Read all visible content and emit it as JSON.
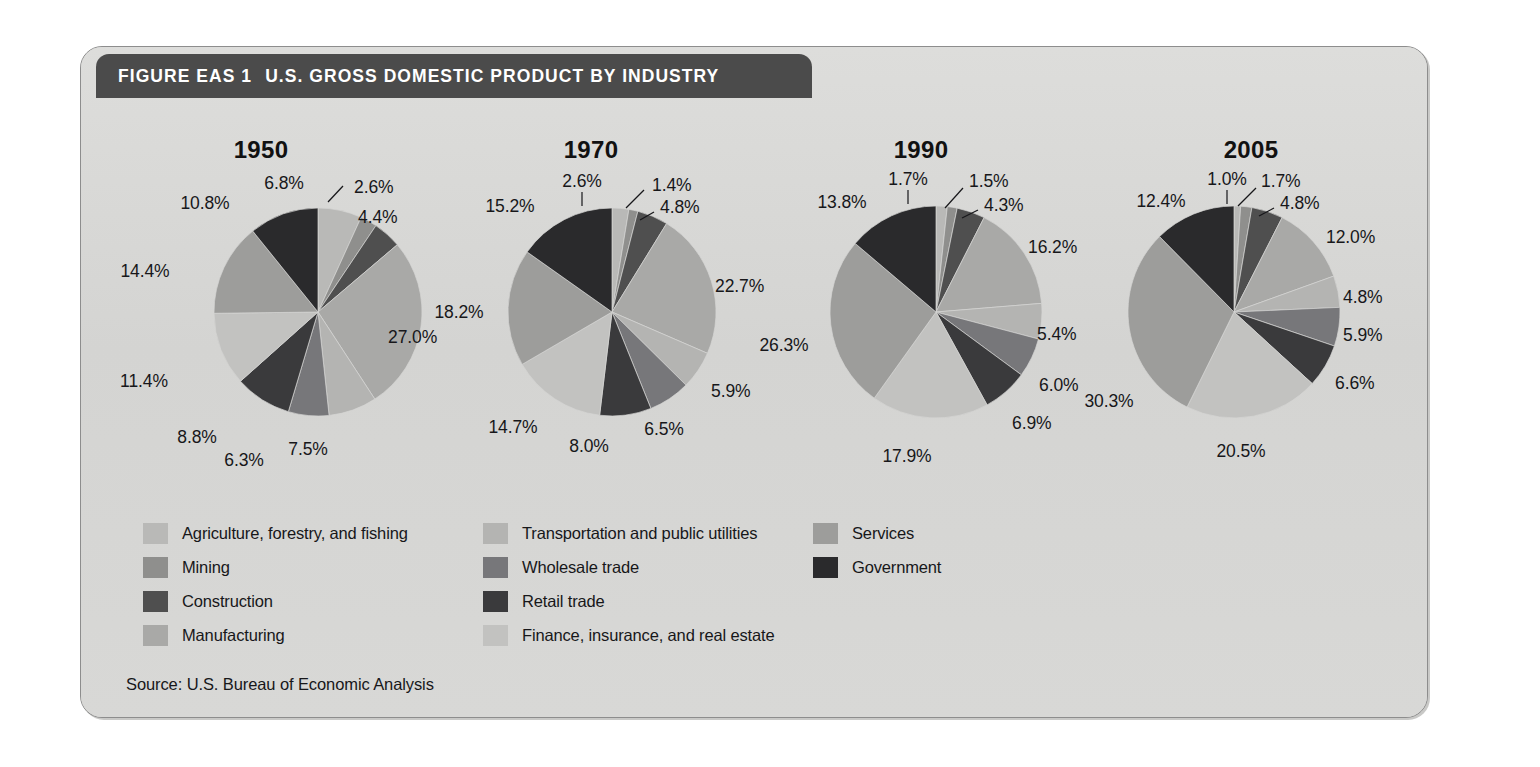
{
  "header": {
    "figure_number": "FIGURE EAS 1",
    "title": "U.S. GROSS DOMESTIC PRODUCT BY INDUSTRY"
  },
  "source": "Source: U.S. Bureau of Economic Analysis",
  "colors": {
    "agriculture": "#b9b9b7",
    "mining": "#8f8f8d",
    "construction": "#4f4f4f",
    "manufacturing": "#a9a9a7",
    "transportation": "#b4b4b2",
    "wholesale": "#77777a",
    "retail": "#3a3a3c",
    "finance": "#c2c2c0",
    "services": "#9d9d9b",
    "government": "#2a2a2c",
    "panel_background": "#d6d6d4",
    "header_bar": "#4b4b4b",
    "text": "#17171a"
  },
  "legend": {
    "columns": [
      [
        {
          "label": "Agriculture, forestry, and fishing",
          "key": "agriculture"
        },
        {
          "label": "Mining",
          "key": "mining"
        },
        {
          "label": "Construction",
          "key": "construction"
        },
        {
          "label": "Manufacturing",
          "key": "manufacturing"
        }
      ],
      [
        {
          "label": "Transportation and public utilities",
          "key": "transportation"
        },
        {
          "label": "Wholesale trade",
          "key": "wholesale"
        },
        {
          "label": "Retail trade",
          "key": "retail"
        },
        {
          "label": "Finance, insurance, and real estate",
          "key": "finance"
        }
      ],
      [
        {
          "label": "Services",
          "key": "services"
        },
        {
          "label": "Government",
          "key": "government"
        }
      ]
    ]
  },
  "chart_data": [
    {
      "type": "pie",
      "title": "1950",
      "unit": "%",
      "start_angle": 0,
      "direction": "clockwise",
      "categories": [
        "Agriculture, forestry, and fishing",
        "Mining",
        "Construction",
        "Manufacturing",
        "Transportation and public utilities",
        "Wholesale trade",
        "Retail trade",
        "Finance, insurance, and real estate",
        "Services",
        "Government"
      ],
      "keys": [
        "agriculture",
        "mining",
        "construction",
        "manufacturing",
        "transportation",
        "wholesale",
        "retail",
        "finance",
        "services",
        "government"
      ],
      "values": [
        6.8,
        2.6,
        4.4,
        27.0,
        7.5,
        6.3,
        8.8,
        11.4,
        14.4,
        10.8
      ],
      "labels": [
        "6.8%",
        "2.6%",
        "4.4%",
        "27.0%",
        "7.5%",
        "6.3%",
        "8.8%",
        "11.4%",
        "14.4%",
        "10.8%"
      ],
      "label_pos": [
        {
          "x": 188,
          "y": 64,
          "anchor": "middle"
        },
        {
          "x": 258,
          "y": 68,
          "anchor": "start"
        },
        {
          "x": 262,
          "y": 98,
          "anchor": "start"
        },
        {
          "x": 292,
          "y": 218,
          "anchor": "start"
        },
        {
          "x": 212,
          "y": 330,
          "anchor": "middle"
        },
        {
          "x": 148,
          "y": 341,
          "anchor": "middle"
        },
        {
          "x": 101,
          "y": 318,
          "anchor": "middle"
        },
        {
          "x": 48,
          "y": 262,
          "anchor": "middle"
        },
        {
          "x": 49,
          "y": 152,
          "anchor": "middle"
        },
        {
          "x": 109,
          "y": 84,
          "anchor": "middle"
        }
      ],
      "leaders": [
        {
          "from": [
            247,
            66
          ],
          "to": [
            232,
            82
          ]
        }
      ],
      "center": [
        222,
        192
      ],
      "radius": 104
    },
    {
      "type": "pie",
      "title": "1970",
      "unit": "%",
      "start_angle": 0,
      "direction": "clockwise",
      "categories": [
        "Agriculture, forestry, and fishing",
        "Mining",
        "Construction",
        "Manufacturing",
        "Transportation and public utilities",
        "Wholesale trade",
        "Retail trade",
        "Finance, insurance, and real estate",
        "Services",
        "Government"
      ],
      "keys": [
        "agriculture",
        "mining",
        "construction",
        "manufacturing",
        "transportation",
        "wholesale",
        "retail",
        "finance",
        "services",
        "government"
      ],
      "values": [
        2.6,
        1.4,
        4.8,
        22.7,
        5.9,
        6.5,
        8.0,
        14.7,
        18.2,
        15.2
      ],
      "labels": [
        "2.6%",
        "1.4%",
        "4.8%",
        "22.7%",
        "5.9%",
        "6.5%",
        "8.0%",
        "14.7%",
        "18.2%",
        "15.2%"
      ],
      "label_pos": [
        {
          "x": 156,
          "y": 62,
          "anchor": "middle"
        },
        {
          "x": 226,
          "y": 66,
          "anchor": "start"
        },
        {
          "x": 234,
          "y": 88,
          "anchor": "start"
        },
        {
          "x": 289,
          "y": 167,
          "anchor": "start"
        },
        {
          "x": 285,
          "y": 272,
          "anchor": "start"
        },
        {
          "x": 238,
          "y": 310,
          "anchor": "middle"
        },
        {
          "x": 163,
          "y": 327,
          "anchor": "middle"
        },
        {
          "x": 87,
          "y": 308,
          "anchor": "middle"
        },
        {
          "x": 33,
          "y": 193,
          "anchor": "middle"
        },
        {
          "x": 84,
          "y": 87,
          "anchor": "middle"
        }
      ],
      "leaders": [
        {
          "from": [
            156,
            72
          ],
          "to": [
            156,
            86
          ]
        },
        {
          "from": [
            218,
            70
          ],
          "to": [
            200,
            88
          ]
        },
        {
          "from": [
            228,
            92
          ],
          "to": [
            214,
            100
          ]
        }
      ],
      "center": [
        186,
        192
      ],
      "radius": 104
    },
    {
      "type": "pie",
      "title": "1990",
      "unit": "%",
      "start_angle": 0,
      "direction": "clockwise",
      "categories": [
        "Agriculture, forestry, and fishing",
        "Mining",
        "Construction",
        "Manufacturing",
        "Transportation and public utilities",
        "Wholesale trade",
        "Retail trade",
        "Finance, insurance, and real estate",
        "Services",
        "Government"
      ],
      "keys": [
        "agriculture",
        "mining",
        "construction",
        "manufacturing",
        "transportation",
        "wholesale",
        "retail",
        "finance",
        "services",
        "government"
      ],
      "values": [
        1.7,
        1.5,
        4.3,
        16.2,
        5.4,
        6.0,
        6.9,
        17.9,
        26.3,
        13.8
      ],
      "labels": [
        "1.7%",
        "1.5%",
        "4.3%",
        "16.2%",
        "5.4%",
        "6.0%",
        "6.9%",
        "17.9%",
        "26.3%",
        "13.8%"
      ],
      "label_pos": [
        {
          "x": 152,
          "y": 60,
          "anchor": "middle"
        },
        {
          "x": 213,
          "y": 62,
          "anchor": "start"
        },
        {
          "x": 228,
          "y": 86,
          "anchor": "start"
        },
        {
          "x": 272,
          "y": 128,
          "anchor": "start"
        },
        {
          "x": 281,
          "y": 215,
          "anchor": "start"
        },
        {
          "x": 283,
          "y": 266,
          "anchor": "start"
        },
        {
          "x": 256,
          "y": 304,
          "anchor": "start"
        },
        {
          "x": 151,
          "y": 337,
          "anchor": "middle"
        },
        {
          "x": 28,
          "y": 226,
          "anchor": "middle"
        },
        {
          "x": 86,
          "y": 83,
          "anchor": "middle"
        }
      ],
      "leaders": [
        {
          "from": [
            152,
            70
          ],
          "to": [
            152,
            84
          ]
        },
        {
          "from": [
            207,
            68
          ],
          "to": [
            189,
            88
          ]
        },
        {
          "from": [
            222,
            90
          ],
          "to": [
            206,
            98
          ]
        }
      ],
      "center": [
        180,
        192
      ],
      "radius": 106
    },
    {
      "type": "pie",
      "title": "2005",
      "unit": "%",
      "start_angle": 0,
      "direction": "clockwise",
      "categories": [
        "Agriculture, forestry, and fishing",
        "Mining",
        "Construction",
        "Manufacturing",
        "Transportation and public utilities",
        "Wholesale trade",
        "Retail trade",
        "Finance, insurance, and real estate",
        "Services",
        "Government"
      ],
      "keys": [
        "agriculture",
        "mining",
        "construction",
        "manufacturing",
        "transportation",
        "wholesale",
        "retail",
        "finance",
        "services",
        "government"
      ],
      "values": [
        1.0,
        1.7,
        4.8,
        12.0,
        4.8,
        5.9,
        6.6,
        20.5,
        30.3,
        12.4
      ],
      "labels": [
        "1.0%",
        "1.7%",
        "4.8%",
        "12.0%",
        "4.8%",
        "5.9%",
        "6.6%",
        "20.5%",
        "30.3%",
        "12.4%"
      ],
      "label_pos": [
        {
          "x": 141,
          "y": 60,
          "anchor": "middle"
        },
        {
          "x": 175,
          "y": 62,
          "anchor": "start"
        },
        {
          "x": 194,
          "y": 84,
          "anchor": "start"
        },
        {
          "x": 240,
          "y": 118,
          "anchor": "start"
        },
        {
          "x": 257,
          "y": 178,
          "anchor": "start"
        },
        {
          "x": 257,
          "y": 216,
          "anchor": "start"
        },
        {
          "x": 249,
          "y": 264,
          "anchor": "start"
        },
        {
          "x": 155,
          "y": 332,
          "anchor": "middle"
        },
        {
          "x": 23,
          "y": 282,
          "anchor": "middle"
        },
        {
          "x": 75,
          "y": 82,
          "anchor": "middle"
        }
      ],
      "leaders": [
        {
          "from": [
            141,
            70
          ],
          "to": [
            141,
            84
          ]
        },
        {
          "from": [
            170,
            68
          ],
          "to": [
            152,
            86
          ]
        },
        {
          "from": [
            188,
            88
          ],
          "to": [
            173,
            96
          ]
        }
      ],
      "center": [
        148,
        192
      ],
      "radius": 106
    }
  ]
}
